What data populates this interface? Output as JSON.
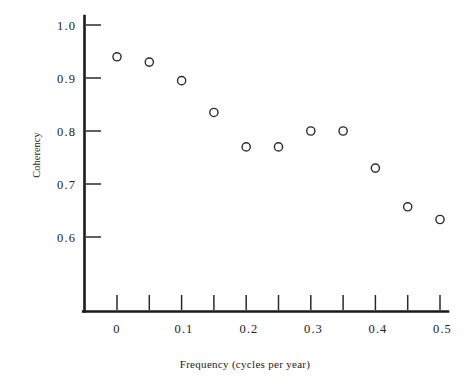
{
  "chart_data": {
    "type": "scatter",
    "title": "",
    "xlabel": "Frequency (cycles per year)",
    "ylabel": "Coherency",
    "x": [
      0.0,
      0.05,
      0.1,
      0.15,
      0.2,
      0.25,
      0.3,
      0.35,
      0.4,
      0.45,
      0.5
    ],
    "values": [
      0.94,
      0.93,
      0.895,
      0.835,
      0.77,
      0.77,
      0.8,
      0.8,
      0.73,
      0.657,
      0.633
    ],
    "series": [
      {
        "name": "Coherency",
        "points": [
          {
            "x": 0.0,
            "y": 0.94
          },
          {
            "x": 0.05,
            "y": 0.93
          },
          {
            "x": 0.1,
            "y": 0.895
          },
          {
            "x": 0.15,
            "y": 0.835
          },
          {
            "x": 0.2,
            "y": 0.77
          },
          {
            "x": 0.25,
            "y": 0.77
          },
          {
            "x": 0.3,
            "y": 0.8
          },
          {
            "x": 0.35,
            "y": 0.8
          },
          {
            "x": 0.4,
            "y": 0.73
          },
          {
            "x": 0.45,
            "y": 0.657
          },
          {
            "x": 0.5,
            "y": 0.633
          }
        ]
      }
    ],
    "xlim": [
      -0.045,
      0.515
    ],
    "ylim": [
      0.545,
      1.02
    ],
    "xticks": [
      0.0,
      0.05,
      0.1,
      0.15,
      0.2,
      0.25,
      0.3,
      0.35,
      0.4,
      0.45,
      0.5
    ],
    "xtick_labels": [
      "0",
      "",
      "0.1",
      "",
      "0.2",
      "",
      "0.3",
      "",
      "0.4",
      "",
      "0.5"
    ],
    "yticks": [
      0.6,
      0.7,
      0.8,
      0.9,
      1.0
    ],
    "ytick_labels": [
      "0.6",
      "0.7",
      "0.8",
      "0.9",
      "1.0"
    ],
    "grid": false,
    "legend": null,
    "marker_style": "open-circle",
    "marker_color": "#2b2b2b",
    "axis_color": "#1a1a1a",
    "background": "#ffffff",
    "tick_direction": "in",
    "spines": [
      "left",
      "bottom"
    ]
  },
  "labels": {
    "y_axis_title": "Coherency",
    "x_axis_title": "Frequency (cycles per year)",
    "y_tick_1_0": "1.0",
    "y_tick_0_9": "0.9",
    "y_tick_0_8": "0.8",
    "y_tick_0_7": "0.7",
    "y_tick_0_6": "0.6",
    "x_tick_0": "0",
    "x_tick_0_1": "0.1",
    "x_tick_0_2": "0.2",
    "x_tick_0_3": "0.3",
    "x_tick_0_4": "0.4",
    "x_tick_0_5": "0.5"
  }
}
